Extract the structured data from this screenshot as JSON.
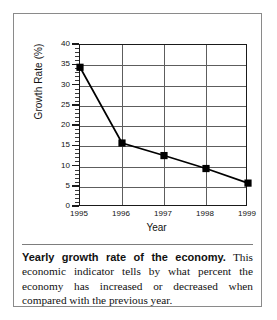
{
  "chart_data": {
    "type": "line",
    "title": "Yearly growth rate of the economy",
    "xlabel": "Year",
    "ylabel": "Growth Rate (%)",
    "categories": [
      "1995",
      "1996",
      "1997",
      "1998",
      "1999"
    ],
    "values": [
      34.5,
      15.8,
      12.7,
      9.5,
      5.9
    ],
    "series": [
      {
        "name": "Growth Rate",
        "values": [
          34.5,
          15.8,
          12.7,
          9.5,
          5.9
        ]
      }
    ],
    "xlim": [
      1995,
      1999
    ],
    "ylim": [
      0,
      40
    ],
    "yticks": [
      0,
      5,
      10,
      15,
      20,
      25,
      30,
      35,
      40
    ],
    "ytick_labels": [
      "0",
      "5",
      "10",
      "15",
      "20",
      "25",
      "30",
      "35",
      "40"
    ],
    "xtick_labels": [
      "1995",
      "1996",
      "1997",
      "1998",
      "1999"
    ],
    "grid": true,
    "legend": "none",
    "marker": "square",
    "line_color": "#000000",
    "marker_color": "#000000",
    "grid_color": "#5d5d5d",
    "axis_color": "#1a1a1a"
  },
  "caption": {
    "lead": "Yearly growth rate of the economy.",
    "body": " This economic indicator tells by what percent the economy has increased or decreased when compared with the previous year."
  }
}
